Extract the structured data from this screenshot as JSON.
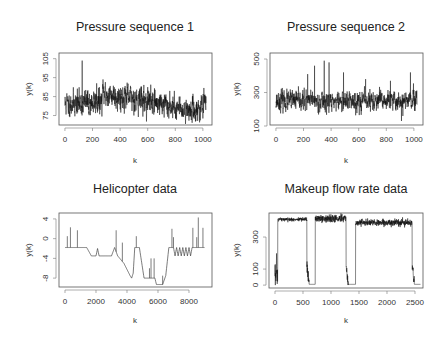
{
  "chart_data": [
    {
      "id": "p1",
      "type": "line",
      "title": "Pressure sequence 1",
      "xlabel": "k",
      "ylabel": "y(k)",
      "xlim": [
        -43,
        1066
      ],
      "ylim": [
        70,
        108
      ],
      "xticks": [
        0,
        200,
        400,
        600,
        800,
        1000
      ],
      "yticks": [
        75,
        85,
        95,
        105
      ],
      "box": {
        "x": 59,
        "y": 53,
        "w": 153,
        "h": 72
      },
      "n": 1024,
      "segments": [
        {
          "from": 0,
          "to": 270,
          "level_start": 81,
          "level_end": 82,
          "noise": 3.2
        },
        {
          "from": 270,
          "to": 420,
          "level_start": 86.5,
          "level_end": 85,
          "noise": 3.2
        },
        {
          "from": 420,
          "to": 750,
          "level_start": 85,
          "level_end": 80.5,
          "noise": 3.2
        },
        {
          "from": 750,
          "to": 950,
          "level_start": 80,
          "level_end": 77.5,
          "noise": 2.8
        },
        {
          "from": 950,
          "to": 1024,
          "level_start": 78,
          "level_end": 81,
          "noise": 3
        }
      ],
      "spikes": [
        {
          "k": 125,
          "y": 104
        },
        {
          "k": 230,
          "y": 92
        },
        {
          "k": 600,
          "y": 90
        },
        {
          "k": 760,
          "y": 88
        }
      ],
      "seed": 11,
      "color": "#111111"
    },
    {
      "id": "p2",
      "type": "line",
      "title": "Pressure sequence 2",
      "xlabel": "k",
      "ylabel": "y(k)",
      "xlim": [
        -43,
        1066
      ],
      "ylim": [
        106,
        536
      ],
      "xticks": [
        0,
        200,
        400,
        600,
        800,
        1000
      ],
      "yticks": [
        100,
        300,
        500
      ],
      "box": {
        "x": 270,
        "y": 53,
        "w": 153,
        "h": 72
      },
      "n": 1024,
      "segments": [
        {
          "from": 0,
          "to": 1024,
          "level_start": 250,
          "level_end": 250,
          "noise": 28
        }
      ],
      "spikes": [
        {
          "k": 230,
          "y": 410
        },
        {
          "k": 280,
          "y": 460
        },
        {
          "k": 350,
          "y": 490
        },
        {
          "k": 385,
          "y": 480
        },
        {
          "k": 490,
          "y": 420
        },
        {
          "k": 650,
          "y": 380
        },
        {
          "k": 830,
          "y": 370
        },
        {
          "k": 975,
          "y": 420
        },
        {
          "k": 910,
          "y": 130
        },
        {
          "k": 920,
          "y": 160
        }
      ],
      "seed": 23,
      "color": "#111111"
    },
    {
      "id": "p3",
      "type": "line",
      "title": "Helicopter data",
      "xlabel": "k",
      "ylabel": "y(k)",
      "xlim": [
        -387,
        9484
      ],
      "ylim": [
        -9.8,
        5.2
      ],
      "xticks": [
        0,
        2000,
        4000,
        6000,
        8000
      ],
      "yticks": [
        4,
        0,
        -4,
        -8
      ],
      "box": {
        "x": 59,
        "y": 213,
        "w": 153,
        "h": 74
      },
      "breakpoints": [
        [
          0,
          -1.8
        ],
        [
          1400,
          -1.8
        ],
        [
          1700,
          -3.5
        ],
        [
          2000,
          -3.5
        ],
        [
          2100,
          -2.0
        ],
        [
          2200,
          -3.5
        ],
        [
          3000,
          -3.5
        ],
        [
          3200,
          -1.8
        ],
        [
          3400,
          -3.5
        ],
        [
          3800,
          -5.0
        ],
        [
          4200,
          -7.5
        ],
        [
          4300,
          -8.0
        ],
        [
          4400,
          -7.0
        ],
        [
          4500,
          -1.8
        ],
        [
          4800,
          -1.8
        ],
        [
          5100,
          -8.0
        ],
        [
          5800,
          -8.0
        ],
        [
          5900,
          -9.3
        ],
        [
          6300,
          -9.3
        ],
        [
          6500,
          -7.5
        ],
        [
          6700,
          -1.8
        ],
        [
          7000,
          -1.8
        ],
        [
          7100,
          -3.5
        ],
        [
          7200,
          -1.8
        ],
        [
          7300,
          -3.5
        ],
        [
          7400,
          -1.8
        ],
        [
          7500,
          -3.5
        ],
        [
          7600,
          -1.8
        ],
        [
          7700,
          -3.5
        ],
        [
          7800,
          -1.8
        ],
        [
          7900,
          -3.5
        ],
        [
          8000,
          -1.8
        ],
        [
          8100,
          -3.5
        ],
        [
          8200,
          -1.8
        ],
        [
          9000,
          -1.8
        ]
      ],
      "spikes": [
        {
          "k": 150,
          "y": 0.5
        },
        {
          "k": 350,
          "y": 2.3
        },
        {
          "k": 800,
          "y": 1.7
        },
        {
          "k": 3300,
          "y": 1.7
        },
        {
          "k": 3700,
          "y": -0.8
        },
        {
          "k": 4600,
          "y": 0.5
        },
        {
          "k": 5450,
          "y": -6.0
        },
        {
          "k": 5550,
          "y": -4.0
        },
        {
          "k": 5750,
          "y": -4.0
        },
        {
          "k": 6300,
          "y": -7.5
        },
        {
          "k": 6900,
          "y": 2.0
        },
        {
          "k": 7000,
          "y": 0.3
        },
        {
          "k": 8250,
          "y": 2.2
        },
        {
          "k": 8500,
          "y": 0.3
        },
        {
          "k": 8600,
          "y": 4.3
        },
        {
          "k": 8900,
          "y": 2.2
        }
      ],
      "color": "#444444"
    },
    {
      "id": "p4",
      "type": "line",
      "title": "Makeup flow rate data",
      "xlabel": "k",
      "ylabel": "y(k)",
      "xlim": [
        -107,
        2643
      ],
      "ylim": [
        -18,
        450
      ],
      "xticks": [
        0,
        500,
        1000,
        1500,
        2000,
        2500
      ],
      "yticks": [
        0,
        100,
        300
      ],
      "ytick_labels": [
        "0",
        "100",
        "300"
      ],
      "box": {
        "x": 269,
        "y": 213,
        "w": 154,
        "h": 75
      },
      "blocks": [
        {
          "start": 50,
          "end": 570,
          "level": 410,
          "noise": 6
        },
        {
          "start": 720,
          "end": 1270,
          "level": 415,
          "noise": 12
        },
        {
          "start": 1440,
          "end": 2450,
          "level": 390,
          "noise": 10
        }
      ],
      "low_segments": [
        {
          "start": 0,
          "end": 50,
          "level": 60,
          "noise": 45
        },
        {
          "start": 570,
          "end": 720,
          "level": 5,
          "noise": 0
        },
        {
          "start": 1270,
          "end": 1440,
          "level": 5,
          "noise": 0
        },
        {
          "start": 2450,
          "end": 2600,
          "level": 5,
          "noise": 0
        }
      ],
      "color": "#111111"
    }
  ]
}
